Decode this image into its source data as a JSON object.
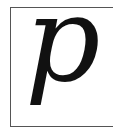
{
  "symbol": {
    "character": "p",
    "style": "italic serif",
    "color": "#111111"
  },
  "frame": {
    "border_color": "#555555",
    "background": "#ffffff"
  }
}
